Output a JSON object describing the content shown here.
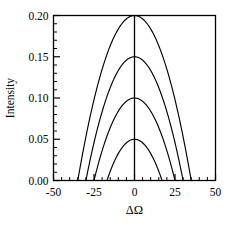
{
  "chart_data": {
    "type": "line",
    "title": "",
    "xlabel": "ΔΩ",
    "ylabel": "Intensity",
    "xlim": [
      -50,
      50
    ],
    "ylim": [
      0.0,
      0.2
    ],
    "grid": false,
    "legend": "none",
    "x_ticks": [
      -50,
      -25,
      0,
      25,
      50
    ],
    "x_tick_labels": [
      "-50",
      "-25",
      "0",
      "25",
      "50"
    ],
    "x_minor_tick_step": 5,
    "y_ticks": [
      0.0,
      0.05,
      0.1,
      0.15,
      0.2
    ],
    "y_tick_labels": [
      "0.00",
      "0.05",
      "0.10",
      "0.15",
      "0.20"
    ],
    "y_minor_tick_step": 0.01,
    "annotations": [
      "vertical line at ΔΩ = 0"
    ],
    "series": [
      {
        "name": "curve-1",
        "peak_y": 0.05,
        "peak_x": 0,
        "half_width": 17,
        "color": "#000000"
      },
      {
        "name": "curve-2",
        "peak_y": 0.1,
        "peak_x": 0,
        "half_width": 25,
        "color": "#000000"
      },
      {
        "name": "curve-3",
        "peak_y": 0.15,
        "peak_x": 0,
        "half_width": 30,
        "color": "#000000"
      },
      {
        "name": "curve-4",
        "peak_y": 0.2,
        "peak_x": 0,
        "half_width": 35,
        "color": "#000000"
      }
    ]
  },
  "axes": {
    "x_title": "ΔΩ",
    "y_title": "Intensity"
  },
  "colors": {
    "stroke": "#000000",
    "background": "#ffffff"
  }
}
